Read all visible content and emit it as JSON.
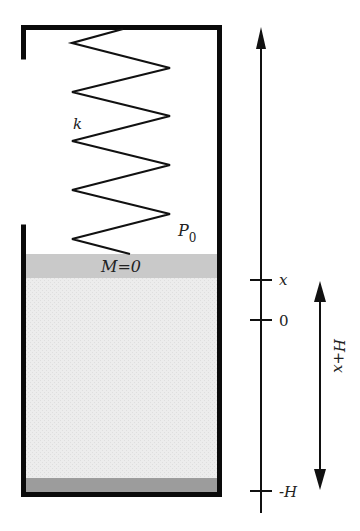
{
  "diagram": {
    "type": "spring-piston-container",
    "labels": {
      "spring_constant": "k",
      "pressure": "P",
      "pressure_subscript": "0",
      "piston": "M=0",
      "tick_x": "x",
      "tick_zero": "0",
      "tick_neg_h": "-H",
      "span": "H+x"
    },
    "colors": {
      "wall": "#0a0a0a",
      "spring": "#111111",
      "piston": "#c9c9c9",
      "fluid": "#ececec",
      "bottom_layer": "#9c9c9c",
      "axis": "#111111"
    },
    "axis": {
      "direction": "up",
      "ticks": [
        "x",
        "0",
        "-H"
      ]
    },
    "span_arrow": {
      "from": "-H",
      "to": "x",
      "label": "H+x"
    }
  }
}
